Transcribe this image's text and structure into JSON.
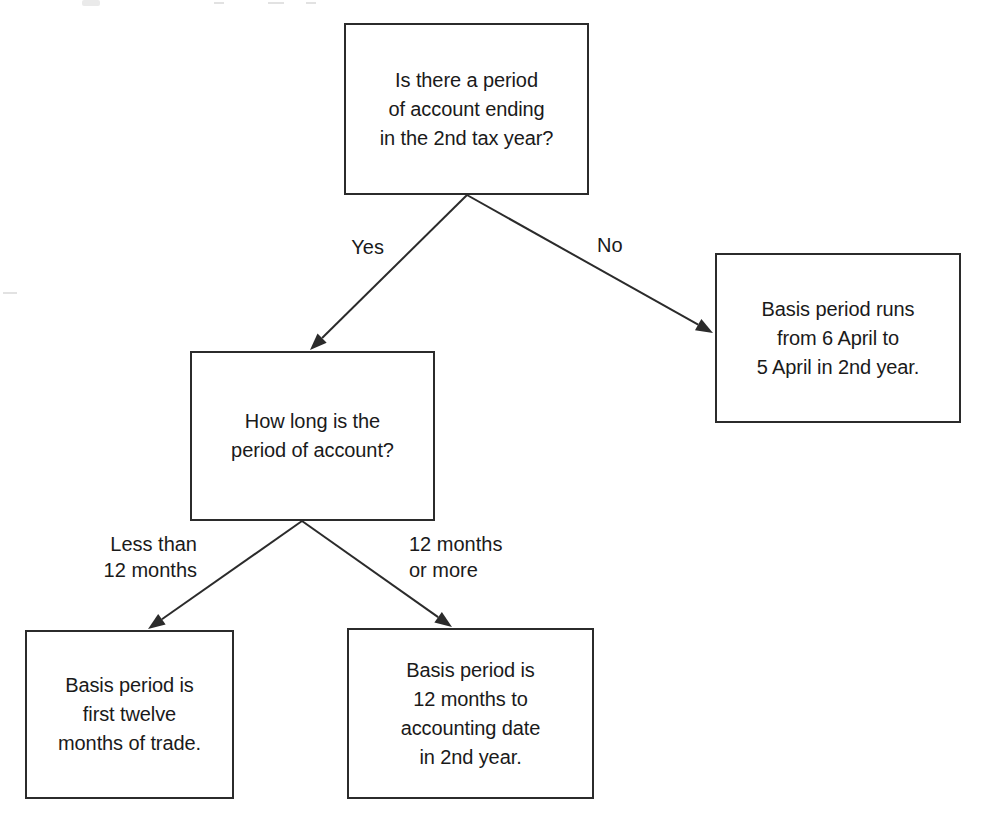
{
  "diagram": {
    "type": "decision-flowchart",
    "nodes": [
      {
        "id": "q-period-of-account",
        "role": "decision",
        "text": "Is there a period\nof account ending\nin the 2nd tax year?",
        "x": 344,
        "y": 23,
        "w": 245,
        "h": 172
      },
      {
        "id": "out-6-april",
        "role": "outcome",
        "text": "Basis period runs\nfrom 6 April to\n5 April in 2nd year.",
        "x": 715,
        "y": 253,
        "w": 246,
        "h": 170
      },
      {
        "id": "q-how-long",
        "role": "decision",
        "text": "How long is the\nperiod of account?",
        "x": 190,
        "y": 351,
        "w": 245,
        "h": 170
      },
      {
        "id": "out-first-twelve",
        "role": "outcome",
        "text": "Basis period is\nfirst twelve\nmonths of trade.",
        "x": 25,
        "y": 630,
        "w": 209,
        "h": 169
      },
      {
        "id": "out-12-months-to-date",
        "role": "outcome",
        "text": "Basis period is\n12 months to\naccounting date\nin 2nd year.",
        "x": 347,
        "y": 628,
        "w": 247,
        "h": 171
      }
    ],
    "edges": [
      {
        "id": "edge-yes",
        "from": "q-period-of-account",
        "to": "q-how-long",
        "label": "Yes",
        "label_x": 332,
        "label_y": 234,
        "label_w": 52,
        "label_align": "right",
        "x1": 467,
        "y1": 195,
        "x2": 310,
        "y2": 350
      },
      {
        "id": "edge-no",
        "from": "q-period-of-account",
        "to": "out-6-april",
        "label": "No",
        "label_x": 597,
        "label_y": 232,
        "label_w": 48,
        "label_align": "left",
        "x1": 467,
        "y1": 195,
        "x2": 713,
        "y2": 333
      },
      {
        "id": "edge-less-than-12",
        "from": "q-how-long",
        "to": "out-first-twelve",
        "label": "Less than\n12 months",
        "label_x": 72,
        "label_y": 531,
        "label_w": 125,
        "label_align": "right",
        "x1": 302,
        "y1": 521,
        "x2": 148,
        "y2": 629
      },
      {
        "id": "edge-12-or-more",
        "from": "q-how-long",
        "to": "out-12-months-to-date",
        "label": "12 months\nor more",
        "label_x": 409,
        "label_y": 531,
        "label_w": 125,
        "label_align": "left",
        "x1": 302,
        "y1": 521,
        "x2": 452,
        "y2": 627
      }
    ],
    "style": {
      "stroke": "#2b2b2b",
      "fill": "#ffffff",
      "text_color": "#1a1a1a",
      "background": "#ffffff",
      "line_width": 2,
      "arrowhead": "solid-triangle"
    }
  }
}
